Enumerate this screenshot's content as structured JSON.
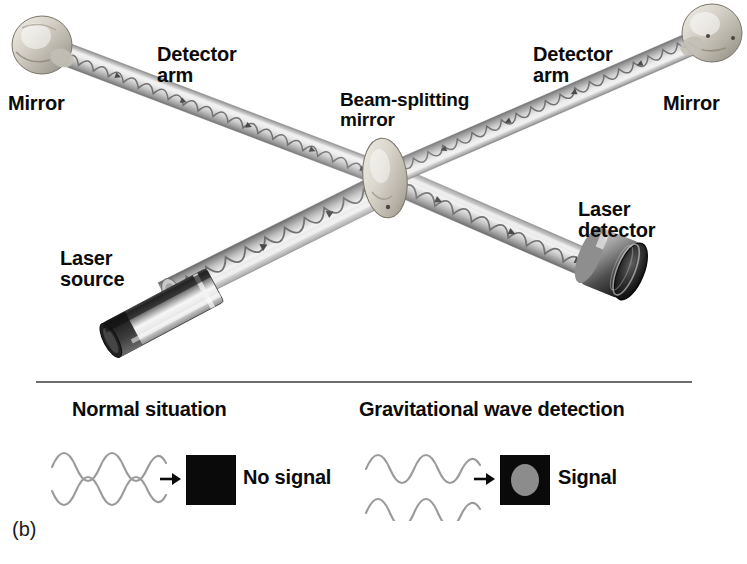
{
  "figure": {
    "caption_label": "(b)",
    "background_color": "#ffffff",
    "ink_color": "#0b0b0b"
  },
  "apparatus": {
    "title": "Michelson interferometer gravitational wave detector",
    "labels": {
      "mirror_left": "Mirror",
      "mirror_right": "Mirror",
      "detector_arm_left": "Detector\narm",
      "detector_arm_right": "Detector\narm",
      "beam_splitter": "Beam-splitting\nmirror",
      "laser_source": "Laser\nsource",
      "laser_detector": "Laser\ndetector"
    },
    "components": [
      {
        "name": "mirror-left",
        "label": "Mirror"
      },
      {
        "name": "mirror-right",
        "label": "Mirror"
      },
      {
        "name": "detector-arm-left",
        "label": "Detector arm"
      },
      {
        "name": "detector-arm-right",
        "label": "Detector arm"
      },
      {
        "name": "beam-splitting-mirror",
        "label": "Beam-splitting mirror"
      },
      {
        "name": "laser-source",
        "label": "Laser source"
      },
      {
        "name": "laser-detector",
        "label": "Laser detector"
      }
    ],
    "colors": {
      "tube_light": "#dcdcdc",
      "tube_mid": "#b4b4b4",
      "tube_dark": "#6f6f6f",
      "mirror_face": "#cfcbc4",
      "laser_body": "#3a3a3a",
      "beam_wave": "#7d7d7d"
    }
  },
  "comparison": {
    "cases": [
      {
        "name": "normal",
        "title": "Normal situation",
        "result": "No signal",
        "wave_phase": "out-of-phase",
        "indicator": {
          "fill": "#0a0a0a",
          "dot": "none"
        }
      },
      {
        "name": "gravitational-wave",
        "title": "Gravitational wave detection",
        "result": "Signal",
        "wave_phase": "in-phase",
        "indicator": {
          "fill": "#0a0a0a",
          "dot": "#8c8c8c"
        }
      }
    ]
  }
}
